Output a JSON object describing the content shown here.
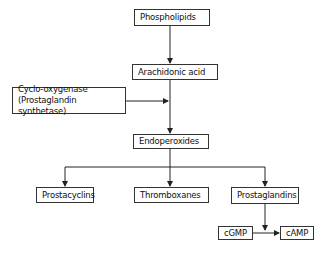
{
  "diagram": {
    "nodes": {
      "phospholipids": "Phospholipids",
      "arachidonic_acid": "Arachidonic acid",
      "cyclooxygenase_line1": "Cyclo-oxygenase",
      "cyclooxygenase_line2": "(Prostaglandin synthetase)",
      "endoperoxides": "Endoperoxides",
      "prostacyclins": "Prostacyclins",
      "thromboxanes": "Thromboxanes",
      "prostaglandins": "Prostaglandins",
      "cgmp": "cGMP",
      "camp": "cAMP"
    },
    "edges": [
      {
        "from": "Phospholipids",
        "to": "Arachidonic acid"
      },
      {
        "from": "Arachidonic acid",
        "to": "Endoperoxides"
      },
      {
        "from": "Cyclo-oxygenase (Prostaglandin synthetase)",
        "to": "Arachidonic acid → Endoperoxides"
      },
      {
        "from": "Endoperoxides",
        "to": "Prostacyclins"
      },
      {
        "from": "Endoperoxides",
        "to": "Thromboxanes"
      },
      {
        "from": "Endoperoxides",
        "to": "Prostaglandins"
      },
      {
        "from": "Prostaglandins",
        "to": "cGMP → cAMP"
      },
      {
        "from": "cGMP",
        "to": "cAMP"
      }
    ],
    "colors": {
      "line": "#222222",
      "box_border": "#333333",
      "background": "#ffffff"
    }
  }
}
